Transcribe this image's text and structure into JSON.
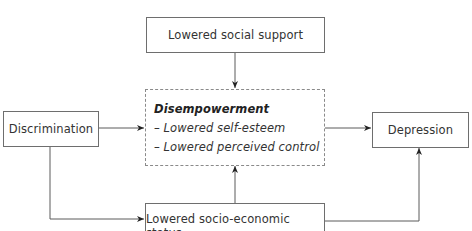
{
  "diagram": {
    "nodes": {
      "social_support": {
        "label": "Lowered social support"
      },
      "discrimination": {
        "label": "Discrimination"
      },
      "disempowerment": {
        "title": "Disempowerment",
        "items": [
          "– Lowered self-esteem",
          "– Lowered perceived control"
        ]
      },
      "depression": {
        "label": "Depression"
      },
      "ses": {
        "label": "Lowered socio-economic status"
      }
    },
    "edges": [
      {
        "from": "Lowered social support",
        "to": "Disempowerment"
      },
      {
        "from": "Discrimination",
        "to": "Disempowerment"
      },
      {
        "from": "Discrimination",
        "to": "Lowered socio-economic status"
      },
      {
        "from": "Lowered socio-economic status",
        "to": "Disempowerment"
      },
      {
        "from": "Disempowerment",
        "to": "Depression"
      },
      {
        "from": "Lowered socio-economic status",
        "to": "Depression"
      }
    ],
    "colors": {
      "line": "#5a5a5a",
      "border": "#6e6e6e",
      "dashed_border": "#8a8a8a",
      "text": "#333333"
    }
  }
}
